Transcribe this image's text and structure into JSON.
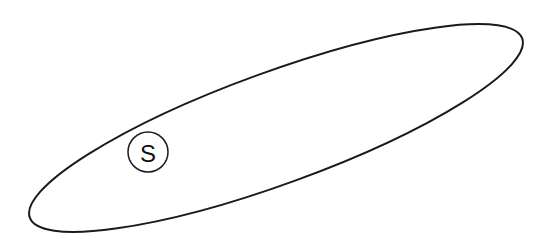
{
  "diagram": {
    "type": "set-region",
    "region": {
      "shape": "ellipse",
      "cx": 276,
      "cy": 128,
      "rx": 262,
      "ry": 56,
      "rotation_deg": -20,
      "stroke": "#1a1a1a",
      "fill": "none"
    },
    "node": {
      "label": "S",
      "cx": 148,
      "cy": 152,
      "r": 20,
      "stroke": "#1a1a1a"
    }
  }
}
